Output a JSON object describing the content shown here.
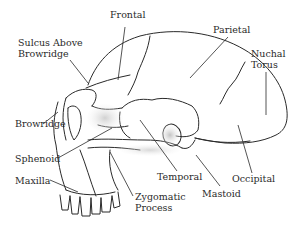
{
  "diagram": {
    "labels": {
      "frontal": "Frontal",
      "parietal": "Parietal",
      "sulcus_line1": "Sulcus Above",
      "sulcus_line2": "Browridge",
      "nuchal_line1": "Nuchal",
      "nuchal_line2": "Torus",
      "browridge": "Browridge",
      "occipital": "Occipital",
      "sphenoid": "Sphenoid",
      "temporal": "Temporal",
      "maxilla": "Maxilla",
      "mastoid": "Mastoid",
      "zygomatic_line1": "Zygomatic",
      "zygomatic_line2": "Process"
    },
    "colors": {
      "ink": "#2a2a2a",
      "shade": "#9a9a9a",
      "background": "#ffffff"
    }
  }
}
